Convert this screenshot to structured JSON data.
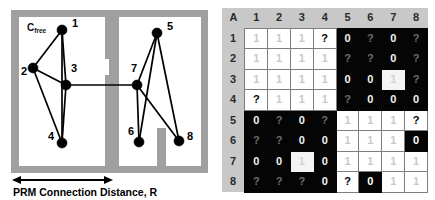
{
  "figure": {
    "left_panel": {
      "region_label": "C",
      "region_label_sub": "free",
      "caption": "PRM Connection Distance, R",
      "nodes": [
        {
          "id": "1",
          "x": 62,
          "y": 30,
          "label_x": 72,
          "label_y": 27
        },
        {
          "id": "2",
          "x": 33,
          "y": 68,
          "label_x": 21,
          "label_y": 75
        },
        {
          "id": "3",
          "x": 66,
          "y": 85,
          "label_x": 71,
          "label_y": 72
        },
        {
          "id": "4",
          "x": 62,
          "y": 143,
          "label_x": 48,
          "label_y": 140
        },
        {
          "id": "5",
          "x": 157,
          "y": 33,
          "label_x": 167,
          "label_y": 30
        },
        {
          "id": "6",
          "x": 139,
          "y": 142,
          "label_x": 128,
          "label_y": 135
        },
        {
          "id": "7",
          "x": 137,
          "y": 85,
          "label_x": 131,
          "label_y": 72
        },
        {
          "id": "8",
          "x": 179,
          "y": 141,
          "label_x": 187,
          "label_y": 140
        }
      ],
      "edges": [
        [
          "1",
          "2"
        ],
        [
          "1",
          "3"
        ],
        [
          "1",
          "4"
        ],
        [
          "2",
          "3"
        ],
        [
          "2",
          "4"
        ],
        [
          "3",
          "4"
        ],
        [
          "3",
          "7"
        ],
        [
          "5",
          "7"
        ],
        [
          "5",
          "6"
        ],
        [
          "5",
          "8"
        ],
        [
          "7",
          "6"
        ],
        [
          "7",
          "8"
        ]
      ]
    },
    "right_panel": {
      "corner_label": "A",
      "column_headers": [
        "1",
        "2",
        "3",
        "4",
        "5",
        "6",
        "7",
        "8"
      ],
      "row_headers": [
        "1",
        "2",
        "3",
        "4",
        "5",
        "6",
        "7",
        "8"
      ],
      "matrix": [
        [
          "1",
          "1",
          "1",
          "?",
          "0",
          "?",
          "0",
          "?"
        ],
        [
          "1",
          "1",
          "1",
          "1",
          "?",
          "?",
          "0",
          "?"
        ],
        [
          "1",
          "1",
          "1",
          "1",
          "0",
          "0",
          "1",
          "?"
        ],
        [
          "?",
          "1",
          "1",
          "1",
          "?",
          "0",
          "0",
          "0"
        ],
        [
          "0",
          "?",
          "0",
          "?",
          "1",
          "1",
          "1",
          "?"
        ],
        [
          "?",
          "?",
          "0",
          "0",
          "1",
          "1",
          "1",
          "0"
        ],
        [
          "0",
          "0",
          "1",
          "0",
          "1",
          "1",
          "1",
          "1"
        ],
        [
          "?",
          "?",
          "?",
          "0",
          "?",
          "0",
          "1",
          "1"
        ]
      ],
      "highlighted_cells": [
        {
          "row": 2,
          "col": 6,
          "style": "hl-white"
        },
        {
          "row": 6,
          "col": 2,
          "style": "hl-white"
        },
        {
          "row": 5,
          "col": 7,
          "style": "hl-black"
        },
        {
          "row": 7,
          "col": 5,
          "style": "hl-black"
        }
      ]
    }
  },
  "colors": {
    "wall": "#a0a0a0",
    "header_band": "#c8c8c8",
    "black_quadrant": "#050505",
    "white_quadrant": "#ffffff",
    "grid_line": "#7d7d7d",
    "node": "#000000"
  }
}
